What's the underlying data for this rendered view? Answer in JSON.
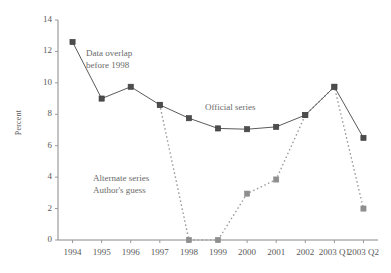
{
  "chart_data": {
    "type": "line",
    "title": "",
    "xlabel": "",
    "ylabel": "Percent",
    "categories": [
      "1994",
      "1995",
      "1996",
      "1997",
      "1998",
      "1999",
      "2000",
      "2001",
      "2002",
      "2003 Q1",
      "2003 Q2"
    ],
    "ylim": [
      0,
      14
    ],
    "yticks": [
      0,
      2,
      4,
      6,
      8,
      10,
      12,
      14
    ],
    "ytick_labels": [
      "0",
      "2",
      "4",
      "6",
      "8",
      "10",
      "12",
      "14"
    ],
    "grid": false,
    "legend": "none",
    "series": [
      {
        "name": "Official series",
        "style": "solid",
        "marker": "square",
        "color": "#5a5a5a",
        "values": [
          12.6,
          9.0,
          9.75,
          8.6,
          7.75,
          7.1,
          7.05,
          7.2,
          7.95,
          9.75,
          6.5
        ]
      },
      {
        "name": "Alternate series",
        "style": "dotted",
        "marker": "square",
        "color": "#9a9a9a",
        "values": [
          null,
          null,
          null,
          8.6,
          0.0,
          0.0,
          2.95,
          3.85,
          7.95,
          9.75,
          2.0
        ]
      }
    ],
    "annotations": [
      {
        "id": "data-overlap",
        "lines": [
          "Data overlap",
          "before 1998"
        ],
        "x": 86,
        "y": 47
      },
      {
        "id": "official-series",
        "lines": [
          "Official series"
        ],
        "x": 205,
        "y": 101
      },
      {
        "id": "alternate-series",
        "lines": [
          "Alternate series",
          "Author's guess"
        ],
        "x": 93,
        "y": 172
      }
    ]
  }
}
